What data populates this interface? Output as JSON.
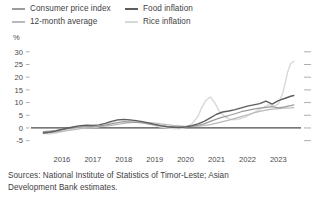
{
  "legend": {
    "entries": [
      {
        "label": "Consumer price index",
        "color": "#9c9c9c",
        "col": 0,
        "row": 0
      },
      {
        "label": "Food inflation",
        "color": "#5e5e5e",
        "col": 1,
        "row": 0
      },
      {
        "label": "12-month average",
        "color": "#b9b9b9",
        "col": 0,
        "row": 1
      },
      {
        "label": "Rice inflation",
        "color": "#d8d8d8",
        "col": 1,
        "row": 1
      }
    ]
  },
  "axis": {
    "unit": "%"
  },
  "source": {
    "line1": "Sources: National Institute of Statistics of Timor-Leste; Asian",
    "line2": "Development Bank estimates."
  },
  "chart_data": {
    "type": "line",
    "title": "",
    "subtitle": "",
    "xlabel": "",
    "ylabel": "%",
    "grid": false,
    "legend_position": "top",
    "xlim": [
      2015.5,
      2024.2
    ],
    "ylim": [
      -7.5,
      31.5
    ],
    "yticks": [
      -5,
      0,
      5,
      10,
      15,
      20,
      25,
      30
    ],
    "ytick_labels": [
      "-5",
      "0",
      "5",
      "10",
      "15",
      "20",
      "25",
      "30"
    ],
    "xticks": [
      2016,
      2017,
      2018,
      2019,
      2020,
      2021,
      2022,
      2023
    ],
    "xtick_labels": [
      "2016",
      "2017",
      "2018",
      "2019",
      "2020",
      "2021",
      "2022",
      "2023"
    ],
    "series": [
      {
        "name": "Consumer price index",
        "color": "#9c9c9c",
        "width": 1.25,
        "x": [
          2015.9,
          2016.1,
          2016.3,
          2016.5,
          2016.7,
          2016.9,
          2017.1,
          2017.3,
          2017.5,
          2017.7,
          2017.9,
          2018.1,
          2018.3,
          2018.5,
          2018.7,
          2018.9,
          2019.1,
          2019.3,
          2019.5,
          2019.7,
          2019.9,
          2020.1,
          2020.3,
          2020.5,
          2020.7,
          2020.9,
          2021.1,
          2021.3,
          2021.5,
          2021.7,
          2021.9,
          2022.1,
          2022.3,
          2022.5,
          2022.7,
          2022.9,
          2023.1,
          2023.3,
          2023.5,
          2023.7,
          2023.9,
          2024.0
        ],
        "y": [
          -1.4,
          -1.2,
          -1.0,
          -0.6,
          -0.3,
          0.1,
          0.4,
          0.6,
          0.5,
          0.7,
          1.1,
          1.6,
          2.1,
          2.5,
          2.4,
          2.2,
          2.0,
          1.6,
          1.2,
          0.8,
          0.6,
          0.5,
          0.4,
          0.5,
          0.7,
          1.0,
          1.6,
          2.6,
          3.5,
          4.3,
          4.9,
          5.6,
          6.4,
          6.9,
          7.4,
          7.8,
          8.1,
          8.4,
          7.9,
          8.3,
          8.8,
          9.1
        ]
      },
      {
        "name": "12-month average",
        "color": "#b9b9b9",
        "width": 1.25,
        "x": [
          2015.9,
          2016.1,
          2016.3,
          2016.5,
          2016.7,
          2016.9,
          2017.1,
          2017.3,
          2017.5,
          2017.7,
          2017.9,
          2018.1,
          2018.3,
          2018.5,
          2018.7,
          2018.9,
          2019.1,
          2019.3,
          2019.5,
          2019.7,
          2019.9,
          2020.1,
          2020.3,
          2020.5,
          2020.7,
          2020.9,
          2021.1,
          2021.3,
          2021.5,
          2021.7,
          2021.9,
          2022.1,
          2022.3,
          2022.5,
          2022.7,
          2022.9,
          2023.1,
          2023.3,
          2023.5,
          2023.7,
          2023.9,
          2024.0
        ],
        "y": [
          -1.8,
          -1.7,
          -1.6,
          -1.3,
          -1.0,
          -0.7,
          -0.3,
          0.0,
          0.3,
          0.5,
          0.7,
          1.0,
          1.4,
          1.8,
          2.1,
          2.2,
          2.2,
          2.1,
          1.9,
          1.6,
          1.3,
          1.0,
          0.8,
          0.6,
          0.6,
          0.7,
          0.9,
          1.3,
          1.9,
          2.5,
          3.1,
          3.8,
          4.5,
          5.2,
          5.9,
          6.5,
          7.0,
          7.4,
          7.6,
          7.8,
          7.9,
          8.0
        ]
      },
      {
        "name": "Food inflation",
        "color": "#5e5e5e",
        "width": 1.4,
        "x": [
          2015.9,
          2016.1,
          2016.3,
          2016.5,
          2016.7,
          2016.9,
          2017.1,
          2017.3,
          2017.5,
          2017.7,
          2017.9,
          2018.1,
          2018.3,
          2018.5,
          2018.7,
          2018.9,
          2019.1,
          2019.3,
          2019.5,
          2019.7,
          2019.9,
          2020.1,
          2020.3,
          2020.5,
          2020.7,
          2020.9,
          2021.1,
          2021.3,
          2021.5,
          2021.7,
          2021.9,
          2022.1,
          2022.3,
          2022.5,
          2022.7,
          2022.9,
          2023.1,
          2023.3,
          2023.5,
          2023.7,
          2023.9,
          2024.0
        ],
        "y": [
          -2.0,
          -1.7,
          -1.2,
          -0.6,
          0.0,
          0.5,
          0.9,
          1.1,
          1.0,
          1.2,
          1.8,
          2.6,
          3.2,
          3.4,
          3.2,
          2.9,
          2.5,
          2.0,
          1.4,
          0.9,
          0.5,
          0.3,
          0.2,
          0.4,
          0.9,
          1.6,
          2.6,
          4.0,
          5.4,
          6.3,
          6.7,
          7.2,
          7.9,
          8.6,
          9.1,
          9.6,
          10.6,
          9.4,
          10.8,
          11.6,
          12.5,
          12.8
        ]
      },
      {
        "name": "Rice inflation",
        "color": "#d8d8d8",
        "width": 1.4,
        "x": [
          2015.9,
          2016.1,
          2016.3,
          2016.5,
          2016.7,
          2016.9,
          2017.1,
          2017.3,
          2017.5,
          2017.7,
          2017.9,
          2018.1,
          2018.3,
          2018.5,
          2018.7,
          2018.9,
          2019.1,
          2019.3,
          2019.5,
          2019.7,
          2019.9,
          2020.1,
          2020.3,
          2020.5,
          2020.7,
          2020.9,
          2021.0,
          2021.15,
          2021.3,
          2021.45,
          2021.6,
          2021.8,
          2022.0,
          2022.2,
          2022.4,
          2022.6,
          2022.8,
          2023.0,
          2023.2,
          2023.35,
          2023.5,
          2023.65,
          2023.8,
          2023.9,
          2024.0
        ],
        "y": [
          -2.2,
          -2.4,
          -2.0,
          -1.4,
          -0.8,
          -0.4,
          0.0,
          0.3,
          0.2,
          0.5,
          1.2,
          2.2,
          3.0,
          3.3,
          3.0,
          2.6,
          2.1,
          1.5,
          0.9,
          0.4,
          0.1,
          -0.2,
          -0.3,
          0.2,
          1.6,
          4.5,
          7.5,
          10.8,
          12.2,
          9.8,
          6.4,
          4.2,
          3.2,
          3.4,
          4.2,
          5.4,
          6.6,
          8.0,
          9.2,
          8.6,
          9.4,
          14.0,
          22.0,
          25.4,
          26.2
        ]
      }
    ]
  }
}
